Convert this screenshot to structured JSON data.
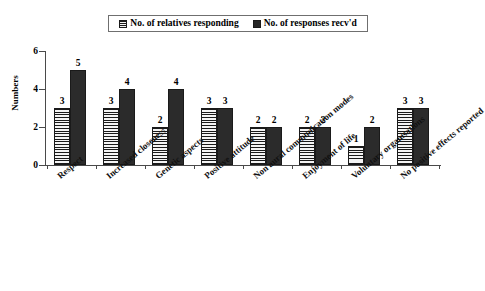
{
  "chart_data": {
    "type": "bar",
    "title": "",
    "xlabel": "",
    "ylabel": "Numbers",
    "ylim": [
      0,
      6
    ],
    "yticks": [
      0,
      2,
      4,
      6
    ],
    "grid": false,
    "legend_position": "top-center",
    "categories": [
      "Respect",
      "Increased closeness",
      "Genetic aspects",
      "Positive attitude",
      "Non aural communication modes",
      "Enjoyment of life",
      "Voluntary organisations",
      "No positive effects reported"
    ],
    "series": [
      {
        "name": "No. of relatives responding",
        "values": [
          3,
          3,
          2,
          3,
          2,
          2,
          1,
          3
        ],
        "fill": "horizontal-hatch",
        "color": "#f4f4f4"
      },
      {
        "name": "No. of responses recv'd",
        "values": [
          5,
          4,
          4,
          3,
          2,
          2,
          2,
          3
        ],
        "fill": "solid",
        "color": "#2b2b2b"
      }
    ],
    "data_labels": true
  },
  "legend": {
    "items": [
      {
        "label": "No. of relatives responding",
        "swatch": "hatched-square-icon"
      },
      {
        "label": "No. of responses recv'd",
        "swatch": "solid-square-icon"
      }
    ]
  },
  "axes": {
    "y_title": "Numbers",
    "y_tick_labels": [
      "6",
      "4",
      "2",
      "0"
    ]
  }
}
